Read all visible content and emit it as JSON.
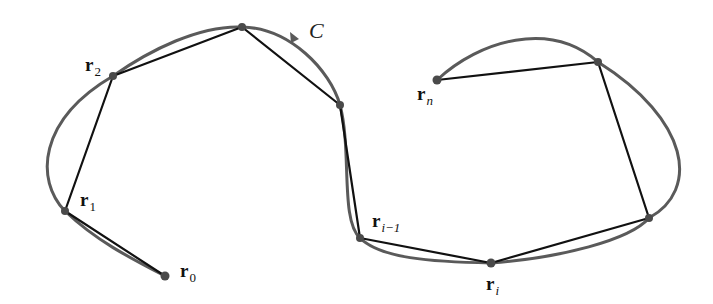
{
  "figure": {
    "curve_label": "C",
    "colors": {
      "curve": "#5a5a5a",
      "polygon": "#111111",
      "point": "#4a4a4a",
      "background": "#ffffff"
    },
    "points": [
      {
        "id": "r0",
        "label_base": "r",
        "label_sub": "0",
        "x": 165,
        "y": 276
      },
      {
        "id": "r1",
        "label_base": "r",
        "label_sub": "1",
        "x": 65,
        "y": 211
      },
      {
        "id": "r2",
        "label_base": "r",
        "label_sub": "2",
        "x": 113,
        "y": 76
      },
      {
        "id": "p3",
        "label_base": "",
        "label_sub": "",
        "x": 242,
        "y": 27
      },
      {
        "id": "p4",
        "label_base": "",
        "label_sub": "",
        "x": 340,
        "y": 105
      },
      {
        "id": "ri-1",
        "label_base": "r",
        "label_sub": "i−1",
        "x": 360,
        "y": 238
      },
      {
        "id": "ri",
        "label_base": "r",
        "label_sub": "i",
        "x": 491,
        "y": 263
      },
      {
        "id": "p7",
        "label_base": "",
        "label_sub": "",
        "x": 649,
        "y": 218
      },
      {
        "id": "p8",
        "label_base": "",
        "label_sub": "",
        "x": 598,
        "y": 62
      },
      {
        "id": "rn",
        "label_base": "r",
        "label_sub": "n",
        "x": 437,
        "y": 80
      }
    ],
    "labels": {
      "r0": {
        "base": "r",
        "sub": "0"
      },
      "r1": {
        "base": "r",
        "sub": "1"
      },
      "r2": {
        "base": "r",
        "sub": "2"
      },
      "ri_minus_1": {
        "base": "r",
        "sub": "i−1"
      },
      "ri": {
        "base": "r",
        "sub": "i"
      },
      "rn": {
        "base": "r",
        "sub": "n"
      }
    }
  }
}
